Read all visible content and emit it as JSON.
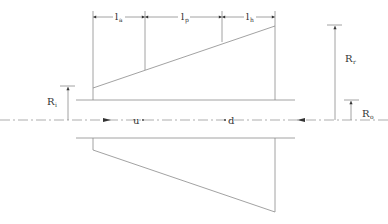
{
  "diagram": {
    "type": "engineering-cross-section",
    "colors": {
      "line": "#8a8a8a",
      "text": "#333333",
      "background": "#ffffff"
    },
    "dimensions_top": [
      {
        "base": "l",
        "sub": "a",
        "x1": 93,
        "x2": 145
      },
      {
        "base": "l",
        "sub": "p",
        "x1": 145,
        "x2": 222
      },
      {
        "base": "l",
        "sub": "h",
        "x1": 222,
        "x2": 275
      }
    ],
    "radius_labels": {
      "ri": {
        "base": "R",
        "sub": "i"
      },
      "rr": {
        "base": "R",
        "sub": "r"
      },
      "ro": {
        "base": "R",
        "sub": "o"
      }
    },
    "flow_labels": {
      "upstream": "u",
      "downstream": "d"
    }
  }
}
